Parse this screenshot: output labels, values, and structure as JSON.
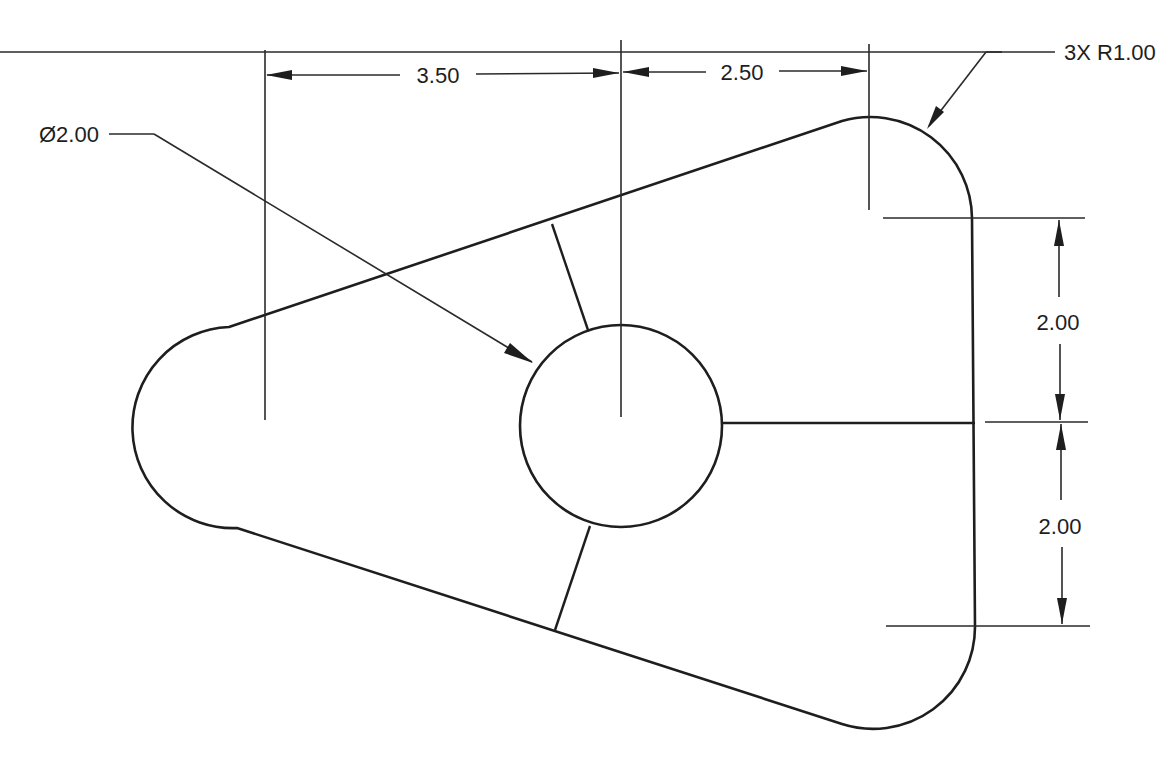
{
  "drawing": {
    "type": "engineering-drawing",
    "description": "Triangular plate with three R1.00 rounded corners, a central Ø2.00 hole, and three radial webs",
    "units": "inches (implied)",
    "colors": {
      "background": "#ffffff",
      "line": "#1e1e1e"
    }
  },
  "dimensions": {
    "horizontal_left": {
      "label": "3.50",
      "value": 3.5,
      "description": "Left arc center to hole center"
    },
    "horizontal_right": {
      "label": "2.50",
      "value": 2.5,
      "description": "Hole center to right arc centers"
    },
    "vertical_upper": {
      "label": "2.00",
      "value": 2.0,
      "description": "Upper arc center to hole centerline"
    },
    "vertical_lower": {
      "label": "2.00",
      "value": 2.0,
      "description": "Hole centerline to lower arc center"
    }
  },
  "callouts": {
    "hole_diameter": {
      "label": "Ø2.00",
      "value": 2.0,
      "description": "Central hole diameter"
    },
    "corner_radius": {
      "label": "3X R1.00",
      "count": 3,
      "value": 1.0,
      "description": "Three corner radii"
    }
  },
  "features": {
    "corner_arcs": [
      {
        "name": "left-arc",
        "center_px": [
          265,
          420
        ],
        "radius_px": 100
      },
      {
        "name": "top-right-arc",
        "center_px": [
          870,
          218
        ],
        "radius_px": 102
      },
      {
        "name": "bottom-right-arc",
        "center_px": [
          873,
          627
        ],
        "radius_px": 102
      }
    ],
    "hole": {
      "center_px": [
        621,
        426
      ],
      "radius_px": 101
    },
    "webs": [
      "upper-left-web",
      "right-web",
      "lower-left-web"
    ]
  }
}
